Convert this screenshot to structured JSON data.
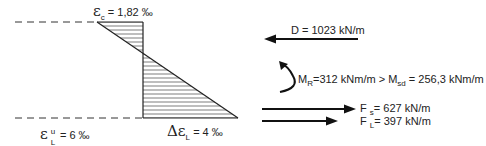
{
  "strain_diagram": {
    "top_strain": {
      "symbol": "ε",
      "subscript": "c",
      "value": "= 1,82 ‰"
    },
    "bottom_left_strain": {
      "symbol": "ε",
      "superscript": "u",
      "subscript": "L",
      "value": "= 6 ‰"
    },
    "bottom_right_strain": {
      "symbol": "Δε",
      "subscript": "L",
      "value": "= 4 ‰"
    }
  },
  "forces": {
    "compression": {
      "label": "D = 1023 kN/m",
      "direction": "left"
    },
    "moment": {
      "prefix": "M",
      "prefix_sub": "R",
      "mid": "=312 kNm/m > M",
      "mid_sub": "sd",
      "suffix": "= 256,3 kNm/m"
    },
    "steel_force": {
      "symbol": "F",
      "subscript": "s",
      "value": "= 627 kN/m",
      "direction": "right"
    },
    "laminate_force": {
      "symbol": "F",
      "subscript": "L",
      "value": "= 397 kN/m",
      "direction": "right"
    }
  }
}
